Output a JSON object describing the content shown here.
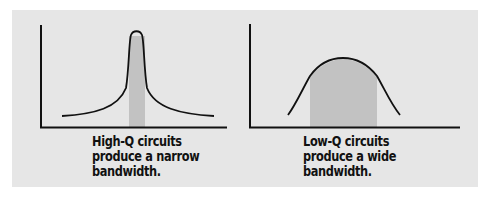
{
  "figure": {
    "background_color": "#e6e6e6",
    "shade_color": "#c2c2c2",
    "line_color": "#111111"
  },
  "panels": [
    {
      "id": "high-q",
      "caption_lines": [
        "High-Q circuits",
        "produce a narrow",
        "bandwidth."
      ],
      "curve_shape": "narrow sharp peak",
      "shaded_band": "narrow"
    },
    {
      "id": "low-q",
      "caption_lines": [
        "Low-Q circuits",
        "produce a wide",
        "bandwidth."
      ],
      "curve_shape": "broad rounded peak",
      "shaded_band": "wide"
    }
  ]
}
